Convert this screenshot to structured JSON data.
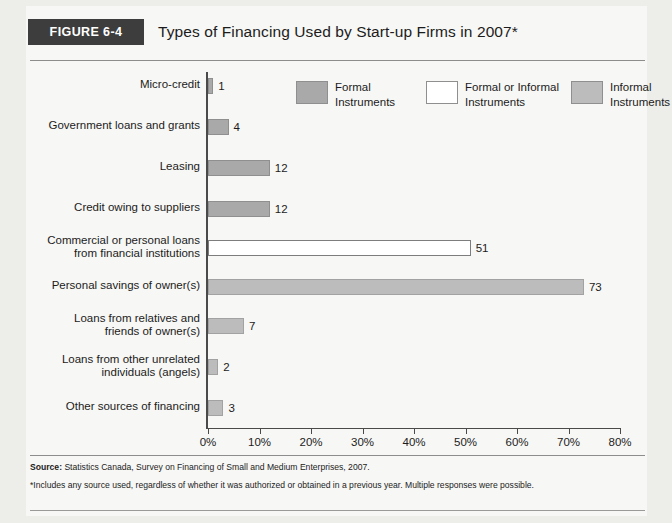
{
  "figure": {
    "badge": "FIGURE 6-4",
    "title": "Types of Financing Used by Start-up Firms in 2007*"
  },
  "colors": {
    "formal": "#a9a9a9",
    "formal_or_informal": "#ffffff",
    "informal": "#bcbcbc",
    "badge_bg": "#3d3d3d",
    "axis": "#4a4a4a",
    "panel_bg": "#f7f7f5"
  },
  "legend": {
    "position": "top-right",
    "items": [
      {
        "label": "Formal\nInstruments",
        "key": "formal",
        "swatch": "#a9a9a9",
        "border": "#8f8f8f"
      },
      {
        "label": "Formal or Informal\nInstruments",
        "key": "formal_or_informal",
        "swatch": "#ffffff",
        "border": "#8f8f8f"
      },
      {
        "label": "Informal\nInstruments",
        "key": "informal",
        "swatch": "#bcbcbc",
        "border": "#8f8f8f"
      }
    ]
  },
  "chart_data": {
    "type": "bar",
    "orientation": "horizontal",
    "title": "Types of Financing Used by Start-up Firms in 2007*",
    "xlabel": "",
    "ylabel": "",
    "xlim": [
      0,
      80
    ],
    "xticks": [
      0,
      10,
      20,
      30,
      40,
      50,
      60,
      70,
      80
    ],
    "xticklabels": [
      "0%",
      "10%",
      "20%",
      "30%",
      "40%",
      "50%",
      "60%",
      "70%",
      "80%"
    ],
    "grid": false,
    "categories": [
      "Micro-credit",
      "Government loans and grants",
      "Leasing",
      "Credit owing to suppliers",
      "Commercial or personal loans\nfrom financial institutions",
      "Personal savings of owner(s)",
      "Loans from relatives and\nfriends of owner(s)",
      "Loans from other unrelated\nindividuals (angels)",
      "Other sources of financing"
    ],
    "values": [
      1,
      4,
      12,
      12,
      51,
      73,
      7,
      2,
      3
    ],
    "data_labels": [
      "1",
      "4",
      "12",
      "12",
      "51",
      "73",
      "7",
      "2",
      "3"
    ],
    "groups": [
      "formal",
      "formal",
      "formal",
      "formal",
      "formal_or_informal",
      "informal",
      "informal",
      "informal",
      "informal"
    ]
  },
  "footer": {
    "source_label": "Source:",
    "source_text": " Statistics Canada, Survey on Financing of Small and Medium Enterprises, 2007.",
    "note": "*Includes any source used, regardless of whether it was authorized or obtained in a previous year. Multiple responses were possible."
  }
}
